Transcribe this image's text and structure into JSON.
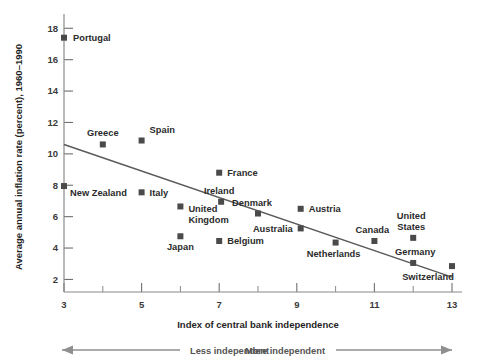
{
  "chart_data": {
    "type": "scatter",
    "title": "",
    "xlabel": "Index of central bank independence",
    "ylabel": "Average annual inflation rate (percent), 1960–1990",
    "xlim": [
      3,
      13
    ],
    "ylim": [
      1.2,
      18.4
    ],
    "grid": false,
    "legend": null,
    "x_ticks": [
      3,
      5,
      7,
      9,
      11,
      13
    ],
    "x_tick_labels": [
      "3",
      "5",
      "7",
      "9",
      "11",
      "13"
    ],
    "x_minor_ticks": [
      4,
      6,
      8,
      10,
      12
    ],
    "y_ticks": [
      2,
      4,
      6,
      8,
      10,
      12,
      14,
      16,
      18
    ],
    "y_tick_labels": [
      "2",
      "4",
      "6",
      "8",
      "10",
      "12",
      "14",
      "16",
      "18"
    ],
    "points": [
      {
        "label": "Portugal",
        "x": 3.0,
        "y": 17.4,
        "label_dx": 9,
        "label_dy": 3.5,
        "anchor": "start"
      },
      {
        "label": "Greece",
        "x": 4.0,
        "y": 10.6,
        "label_dx": 0,
        "label_dy": -8,
        "anchor": "middle"
      },
      {
        "label": "Spain",
        "x": 5.0,
        "y": 10.85,
        "label_dx": 8,
        "label_dy": -8,
        "anchor": "start"
      },
      {
        "label": "New Zealand",
        "x": 3.0,
        "y": 7.95,
        "label_dx": 6,
        "label_dy": 10,
        "anchor": "start"
      },
      {
        "label": "Italy",
        "x": 5.0,
        "y": 7.55,
        "label_dx": 8,
        "label_dy": 3.5,
        "anchor": "start"
      },
      {
        "label": "France",
        "x": 7.0,
        "y": 8.8,
        "label_dx": 8,
        "label_dy": 3.5,
        "anchor": "start"
      },
      {
        "label": "Ireland",
        "x": 7.05,
        "y": 6.95,
        "label_dx": -2,
        "label_dy": -8,
        "anchor": "middle"
      },
      {
        "label": "United",
        "x": 6.0,
        "y": 6.65,
        "label_dx": 8,
        "label_dy": 6,
        "anchor": "start"
      },
      {
        "label": "Kingdom",
        "x": 6.0,
        "y": 6.65,
        "label_dx": 8,
        "label_dy": 17,
        "anchor": "start",
        "marker": false
      },
      {
        "label": "Denmark",
        "x": 8.0,
        "y": 6.2,
        "label_dx": -6,
        "label_dy": -8,
        "anchor": "middle"
      },
      {
        "label": "Austria",
        "x": 9.1,
        "y": 6.5,
        "label_dx": 8,
        "label_dy": 3.5,
        "anchor": "start"
      },
      {
        "label": "Australia",
        "x": 9.1,
        "y": 5.25,
        "label_dx": -8,
        "label_dy": 3.5,
        "anchor": "end"
      },
      {
        "label": "Belgium",
        "x": 7.0,
        "y": 4.45,
        "label_dx": 8,
        "label_dy": 3.5,
        "anchor": "start"
      },
      {
        "label": "Japan",
        "x": 6.0,
        "y": 4.75,
        "label_dx": 0,
        "label_dy": 14,
        "anchor": "middle"
      },
      {
        "label": "Netherlands",
        "x": 10.0,
        "y": 4.35,
        "label_dx": -2,
        "label_dy": 14,
        "anchor": "middle"
      },
      {
        "label": "Canada",
        "x": 11.0,
        "y": 4.45,
        "label_dx": -2,
        "label_dy": -8,
        "anchor": "middle"
      },
      {
        "label": "United",
        "x": 12.0,
        "y": 4.65,
        "label_dx": -2,
        "label_dy": -19,
        "anchor": "middle"
      },
      {
        "label": "States",
        "x": 12.0,
        "y": 4.65,
        "label_dx": -2,
        "label_dy": -8,
        "anchor": "middle",
        "marker": false
      },
      {
        "label": "Germany",
        "x": 12.0,
        "y": 3.05,
        "label_dx": 2,
        "label_dy": -8,
        "anchor": "middle"
      },
      {
        "label": "Switzerland",
        "x": 13.0,
        "y": 2.85,
        "label_dx": -24,
        "label_dy": 14,
        "anchor": "middle"
      }
    ],
    "trend_line": {
      "x1": 3.0,
      "y1": 10.6,
      "x2": 13.0,
      "y2": 2.15
    },
    "annotations": [
      {
        "name": "less-independent",
        "text": "Less independent",
        "direction": "left"
      },
      {
        "name": "more-independent",
        "text": "More independent",
        "direction": "right"
      }
    ]
  }
}
